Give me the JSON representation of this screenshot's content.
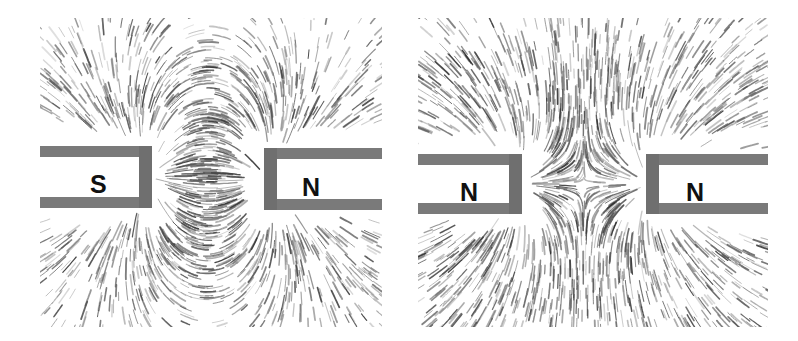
{
  "figure": {
    "background_color": "#ffffff",
    "width": 798,
    "height": 341,
    "filings_color": "#5a5a5a",
    "magnet_body_color": "#7a7a7a",
    "magnet_edge_color": "#6f6f6f",
    "letter_color": "#111111"
  },
  "panels": [
    {
      "id": "attraction-panel",
      "name": "unlike-poles-attraction",
      "caption": "",
      "x": 40,
      "y": 18,
      "width": 342,
      "height": 309,
      "field_type": "attraction",
      "magnets": [
        {
          "id": "left-magnet-south",
          "pole_label": "S",
          "side": "left",
          "x": 0,
          "y": 128,
          "width": 112,
          "height": 62,
          "letter_x": 50,
          "letter_y": 26,
          "letter_size": 25
        },
        {
          "id": "right-magnet-north",
          "pole_label": "N",
          "side": "right",
          "x": 224,
          "y": 130,
          "width": 118,
          "height": 62,
          "letter_x": 38,
          "letter_y": 27,
          "letter_size": 25
        }
      ]
    },
    {
      "id": "repulsion-panel",
      "name": "like-poles-repulsion",
      "caption": "",
      "x": 418,
      "y": 18,
      "width": 350,
      "height": 309,
      "field_type": "repulsion",
      "magnets": [
        {
          "id": "left-magnet-north",
          "pole_label": "N",
          "side": "left",
          "x": 0,
          "y": 136,
          "width": 104,
          "height": 60,
          "letter_x": 42,
          "letter_y": 26,
          "letter_size": 25
        },
        {
          "id": "right-magnet-north-2",
          "pole_label": "N",
          "side": "right",
          "x": 228,
          "y": 136,
          "width": 122,
          "height": 60,
          "letter_x": 40,
          "letter_y": 26,
          "letter_size": 25
        }
      ]
    }
  ]
}
